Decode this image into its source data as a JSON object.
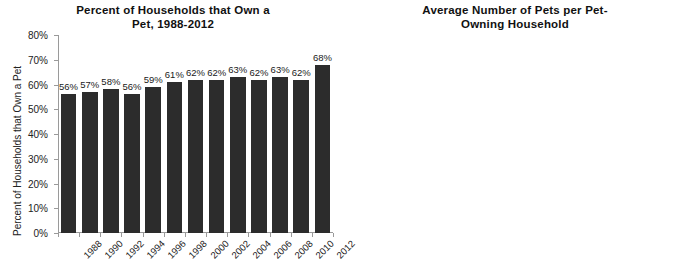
{
  "chart_data": [
    {
      "type": "bar",
      "id": "household-pet-ownership",
      "title": "Percent of Households that Own a Pet, 1988-2012",
      "title_line1": "Percent of Households that Own a",
      "title_line2": "Pet, 1988-2012",
      "xlabel": "",
      "ylabel": "Percent of Households that Own a Pet",
      "ylim": [
        0,
        80
      ],
      "ytick_labels": [
        "0%",
        "10%",
        "20%",
        "30%",
        "40%",
        "50%",
        "60%",
        "70%",
        "80%"
      ],
      "yticks": [
        0,
        10,
        20,
        30,
        40,
        50,
        60,
        70,
        80
      ],
      "grid": false,
      "legend": "none",
      "categories": [
        "1988",
        "1990",
        "1992",
        "1994",
        "1996",
        "1998",
        "2000",
        "2002",
        "2004",
        "2006",
        "2008",
        "2010",
        "2012"
      ],
      "values": [
        56,
        57,
        58,
        56,
        59,
        61,
        62,
        62,
        63,
        62,
        63,
        62,
        68
      ],
      "value_labels": [
        "56%",
        "57%",
        "58%",
        "56%",
        "59%",
        "61%",
        "62%",
        "62%",
        "63%",
        "62%",
        "63%",
        "62%",
        "68%"
      ],
      "bar_color": "#2c2c2c"
    },
    {
      "type": "bar",
      "id": "avg-pets-per-owning-household",
      "title": "Average Number of Pets per Pet-Owning Household",
      "title_line1": "Average Number of Pets per Pet-",
      "title_line2": "Owning Household",
      "xlabel": "",
      "ylabel": "Average Number of Pets per Owning HH",
      "ylim": [
        0,
        12
      ],
      "ytick_labels": [
        "0",
        "2",
        "4",
        "6",
        "8",
        "10",
        "12"
      ],
      "yticks": [
        0,
        2,
        4,
        6,
        8,
        10,
        12
      ],
      "grid": false,
      "legend_position": "top-center",
      "categories": [
        "Cats",
        "Dogs",
        "Small Animals and Reptiles",
        "Birds",
        "Freshwater Fish"
      ],
      "category_lines": [
        [
          "Cats"
        ],
        [
          "Dogs"
        ],
        [
          "Small",
          "Animals",
          "and Reptiles"
        ],
        [
          "Birds"
        ],
        [
          "Freshwater",
          "Fish"
        ]
      ],
      "series": [
        {
          "name": "1992",
          "color": "#2b2b2b",
          "values": [
            1.9,
            1.5,
            1.8,
            2.1,
            9.7
          ],
          "value_labels": [
            "1.9",
            "1.5",
            "1.8",
            "2.1",
            "9.7"
          ]
        },
        {
          "name": "2012",
          "color": "#d8d8d8",
          "values": [
            2.1,
            1.5,
            2.4,
            3.0,
            10.1
          ],
          "value_labels": [
            "2.1",
            "1.5",
            "2.4",
            "3.0",
            "10.1"
          ]
        }
      ]
    }
  ]
}
